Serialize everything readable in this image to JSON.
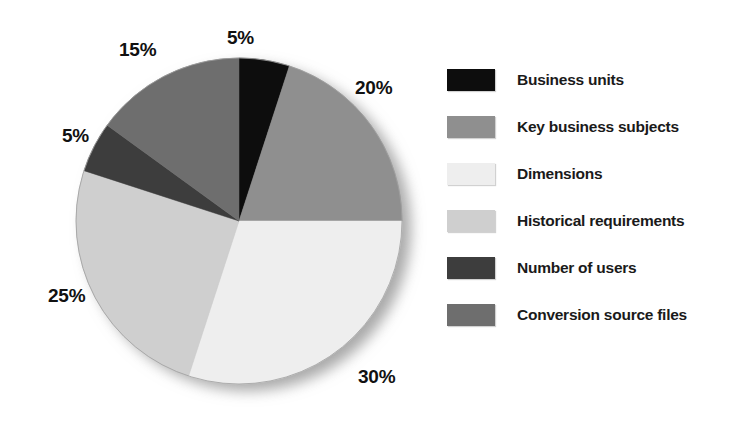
{
  "chart_data": {
    "type": "pie",
    "title": "",
    "subtitle": "",
    "xlabel": "",
    "ylabel": "",
    "legend_position": "right",
    "grid": false,
    "start_angle_deg": 0,
    "direction": "clockwise",
    "categories": [
      "Business units",
      "Key business subjects",
      "Dimensions",
      "Historical requirements",
      "Number of users",
      "Conversion source files"
    ],
    "values": [
      5,
      20,
      30,
      25,
      5,
      15
    ],
    "value_labels": [
      "5%",
      "20%",
      "30%",
      "25%",
      "5%",
      "15%"
    ],
    "colors": [
      "#0d0d0d",
      "#8f8f8f",
      "#eeeeee",
      "#cfcfcf",
      "#3d3d3d",
      "#6e6e6e"
    ],
    "units": "percent",
    "total": 100,
    "slices": [
      {
        "label": "Business units",
        "value": 5,
        "value_label": "5%",
        "color": "#0d0d0d",
        "start_deg": 0,
        "end_deg": 18
      },
      {
        "label": "Key business subjects",
        "value": 20,
        "value_label": "20%",
        "color": "#8f8f8f",
        "start_deg": 18,
        "end_deg": 90
      },
      {
        "label": "Dimensions",
        "value": 30,
        "value_label": "30%",
        "color": "#eeeeee",
        "start_deg": 90,
        "end_deg": 198
      },
      {
        "label": "Historical requirements",
        "value": 25,
        "value_label": "25%",
        "color": "#cfcfcf",
        "start_deg": 198,
        "end_deg": 288
      },
      {
        "label": "Number of users",
        "value": 5,
        "value_label": "5%",
        "color": "#3d3d3d",
        "start_deg": 288,
        "end_deg": 306
      },
      {
        "label": "Conversion source files",
        "value": 15,
        "value_label": "15%",
        "color": "#6e6e6e",
        "start_deg": 306,
        "end_deg": 360
      }
    ]
  },
  "pie": {
    "labels": {
      "business_units": "5%",
      "key_business_subjects": "20%",
      "dimensions": "30%",
      "historical_requirements": "25%",
      "number_of_users": "5%",
      "conversion_source_files": "15%"
    }
  },
  "legend": {
    "items": [
      {
        "label": "Business units",
        "color": "#0d0d0d"
      },
      {
        "label": "Key business subjects",
        "color": "#8f8f8f"
      },
      {
        "label": "Dimensions",
        "color": "#eeeeee"
      },
      {
        "label": "Historical requirements",
        "color": "#cfcfcf"
      },
      {
        "label": "Number of users",
        "color": "#3d3d3d"
      },
      {
        "label": "Conversion source files",
        "color": "#6e6e6e"
      }
    ]
  },
  "colors": {
    "background": "#ffffff",
    "text": "#111111",
    "shadow": "#b9b9b9"
  }
}
